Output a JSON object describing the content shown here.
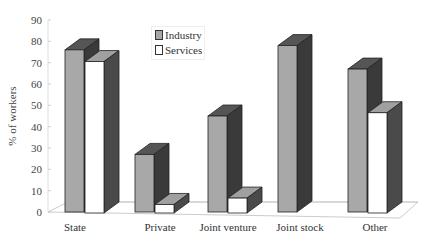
{
  "chart_data": {
    "type": "bar",
    "title": "",
    "xlabel": "",
    "ylabel": "% of workers",
    "ylim": [
      0,
      90
    ],
    "yticks": [
      0,
      10,
      20,
      30,
      40,
      50,
      60,
      70,
      80,
      90
    ],
    "categories": [
      "State",
      "Private",
      "Joint venture",
      "Joint stock",
      "Other"
    ],
    "series": [
      {
        "name": "Industry",
        "values": [
          76,
          27,
          45,
          78,
          67
        ],
        "color": "#a6a6a6"
      },
      {
        "name": "Services",
        "values": [
          71,
          4,
          7,
          null,
          47
        ],
        "color": "#ffffff"
      }
    ],
    "legend_position": "top-left inside",
    "grid": false,
    "style": "3d"
  },
  "legend": {
    "items": [
      {
        "label": "Industry"
      },
      {
        "label": "Services"
      }
    ]
  }
}
